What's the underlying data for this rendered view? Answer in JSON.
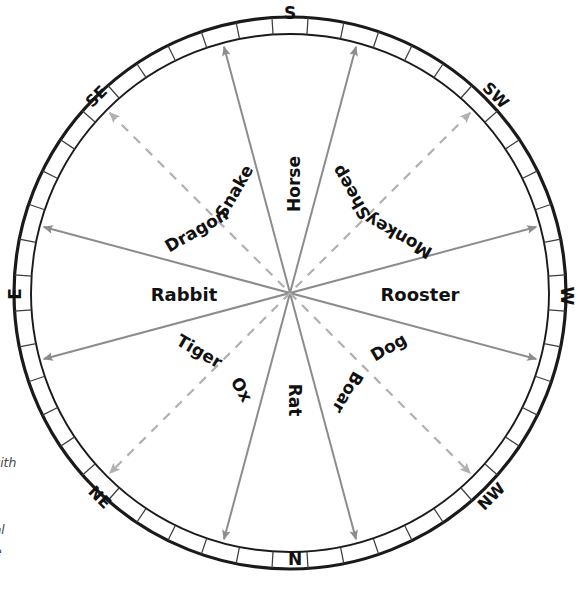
{
  "figure": {
    "type": "compass-zodiac-diagram",
    "center": {
      "x": 290,
      "y": 293
    },
    "outer_radius": 276,
    "inner_radius": 259,
    "rim_ticks": 48
  },
  "colors": {
    "rim_stroke": "#1a1a1a",
    "tick_stroke": "#3d3d3d",
    "arrow_solid": "#8c8c8c",
    "arrow_dashed": "#b0b0b0",
    "label_text": "#111111",
    "direction_text": "#111111",
    "caption_text": "#4a4a4a",
    "background": "#ffffff"
  },
  "directions": [
    {
      "name": "S",
      "label": "S",
      "angle_deg": 270,
      "rotate": 0,
      "x": 290,
      "y": 14,
      "size": 17
    },
    {
      "name": "N",
      "label": "N",
      "angle_deg": 90,
      "rotate": 0,
      "x": 295,
      "y": 560,
      "size": 17
    },
    {
      "name": "E",
      "label": "E",
      "angle_deg": 180,
      "rotate": -90,
      "x": 16,
      "y": 294,
      "size": 17
    },
    {
      "name": "W",
      "label": "W",
      "angle_deg": 0,
      "rotate": 90,
      "x": 566,
      "y": 296,
      "size": 17
    },
    {
      "name": "SE",
      "label": "SE",
      "angle_deg": 225,
      "rotate": -45,
      "x": 97,
      "y": 97,
      "size": 16
    },
    {
      "name": "SW",
      "label": "SW",
      "angle_deg": 315,
      "rotate": 45,
      "x": 495,
      "y": 96,
      "size": 16
    },
    {
      "name": "NE",
      "label": "NE",
      "angle_deg": 135,
      "rotate": 45,
      "x": 99,
      "y": 498,
      "size": 16
    },
    {
      "name": "NW",
      "label": "NW",
      "angle_deg": 45,
      "rotate": -45,
      "x": 492,
      "y": 497,
      "size": 16
    }
  ],
  "arrows": [
    {
      "name": "horse-snake-axis",
      "style": "solid",
      "angle_deg": 255,
      "from": "Snake",
      "to": "Horse"
    },
    {
      "name": "sheep-ox-axis",
      "style": "solid",
      "angle_deg": 285,
      "from": "Ox",
      "to": "Sheep"
    },
    {
      "name": "dragon-rooster-axis",
      "style": "solid",
      "angle_deg": 195,
      "from": "Rooster",
      "to": "Dragon"
    },
    {
      "name": "monkey-rabbit-axis",
      "style": "solid",
      "angle_deg": 345,
      "from": "Rabbit",
      "to": "Monkey"
    },
    {
      "name": "tiger-dog-axis",
      "style": "solid",
      "angle_deg": 165,
      "from": "Dog",
      "to": "Tiger"
    },
    {
      "name": "boar-rat-axis",
      "style": "solid",
      "angle_deg": 15,
      "from": "Rat",
      "to": "Boar"
    },
    {
      "name": "rat-horse-axis",
      "style": "solid",
      "angle_deg": 75,
      "from": "Horse",
      "to": "Rat"
    },
    {
      "name": "ox-sheep-axis",
      "style": "solid",
      "angle_deg": 105,
      "from": "Sheep",
      "to": "Ox"
    },
    {
      "name": "se-dashed-axis",
      "style": "dashed",
      "angle_deg": 225,
      "from": "center",
      "to": "SE"
    },
    {
      "name": "sw-dashed-axis",
      "style": "dashed",
      "angle_deg": 315,
      "from": "center",
      "to": "SW"
    },
    {
      "name": "ne-dashed-axis",
      "style": "dashed",
      "angle_deg": 135,
      "from": "center",
      "to": "NE"
    },
    {
      "name": "nw-dashed-axis",
      "style": "dashed",
      "angle_deg": 45,
      "from": "center",
      "to": "NW"
    }
  ],
  "zodiac": [
    {
      "name": "snake",
      "label": "Snake",
      "x": 235,
      "y": 192,
      "rotate": -60,
      "size": 17,
      "bold": true
    },
    {
      "name": "horse",
      "label": "Horse",
      "x": 295,
      "y": 184,
      "rotate": -90,
      "size": 17,
      "bold": true
    },
    {
      "name": "sheep",
      "label": "Sheep",
      "x": 352,
      "y": 192,
      "rotate": -120,
      "size": 17,
      "bold": true
    },
    {
      "name": "dragon",
      "label": "Dragon",
      "x": 197,
      "y": 231,
      "rotate": -30,
      "size": 17,
      "bold": true
    },
    {
      "name": "monkey",
      "label": "Monkey",
      "x": 399,
      "y": 235,
      "rotate": -150,
      "size": 17,
      "bold": true
    },
    {
      "name": "rabbit",
      "label": "Rabbit",
      "x": 184,
      "y": 296,
      "rotate": 0,
      "size": 18,
      "bold": true
    },
    {
      "name": "rooster",
      "label": "Rooster",
      "x": 420,
      "y": 296,
      "rotate": 0,
      "size": 18,
      "bold": true
    },
    {
      "name": "tiger",
      "label": "Tiger",
      "x": 199,
      "y": 352,
      "rotate": 30,
      "size": 17,
      "bold": true
    },
    {
      "name": "dog",
      "label": "Dog",
      "x": 389,
      "y": 348,
      "rotate": -30,
      "size": 17,
      "bold": true
    },
    {
      "name": "ox",
      "label": "Ox",
      "x": 241,
      "y": 390,
      "rotate": 60,
      "size": 17,
      "bold": true
    },
    {
      "name": "rat",
      "label": "Rat",
      "x": 294,
      "y": 400,
      "rotate": 90,
      "size": 17,
      "bold": true
    },
    {
      "name": "boar",
      "label": "Boar",
      "x": 347,
      "y": 392,
      "rotate": 120,
      "size": 17,
      "bold": true
    }
  ],
  "caption": {
    "name": "figure-caption",
    "lines": [
      "d with",
      "ns.",
      "ts",
      "imal",
      "iate",
      "vo."
    ],
    "note": "clipped at left image edge"
  },
  "chart_data": {
    "type": "pie",
    "title": "",
    "categories": [
      "Snake",
      "Horse",
      "Sheep",
      "Dragon",
      "Monkey",
      "Rabbit",
      "Rooster",
      "Tiger",
      "Dog",
      "Ox",
      "Rat",
      "Boar"
    ],
    "values": [
      30,
      30,
      30,
      30,
      30,
      30,
      30,
      30,
      30,
      30,
      30,
      30
    ],
    "annotations": [
      "S",
      "SW",
      "W",
      "NW",
      "N",
      "NE",
      "E",
      "SE"
    ],
    "legend": "none",
    "grid": false
  }
}
